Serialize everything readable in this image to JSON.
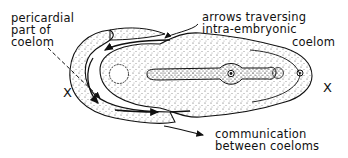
{
  "diagram": {
    "labels": {
      "pericardial": "pericardial\npart of\ncoelom",
      "arrows": "arrows traversing\nintra-embryonic",
      "arrows_line3": "coelom",
      "communication": "communication\nbetween coeloms"
    },
    "markers": {
      "left_x": "X",
      "right_x": "X"
    },
    "colors": {
      "ink": "#111111",
      "background": "#ffffff"
    }
  }
}
